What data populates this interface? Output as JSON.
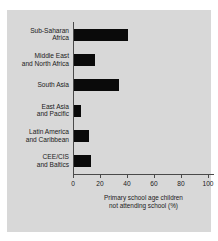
{
  "chart_data": {
    "type": "bar",
    "orientation": "horizontal",
    "title": "",
    "subtitle": "",
    "xlabel": "Primary school age children\nnot attending school (%)",
    "ylabel": "",
    "xlim": [
      0,
      100
    ],
    "xticks": [
      0,
      20,
      40,
      60,
      80,
      100
    ],
    "xtick_labels": [
      "0",
      "20",
      "40",
      "60",
      "80",
      "100"
    ],
    "grid": false,
    "legend": null,
    "bar_color": "#0a0a0a",
    "background_color": "#d8d8d8",
    "axis_color": "#4a4a4a",
    "categories": [
      "Sub-Saharan\nAfrica",
      "Middle East\nand North Africa",
      "South Asia",
      "East Asia\nand Pacific",
      "Latin America\nand Caribbean",
      "CEE/CIS\nand Baltics"
    ],
    "values": [
      41,
      16,
      34,
      6,
      12,
      13
    ]
  }
}
